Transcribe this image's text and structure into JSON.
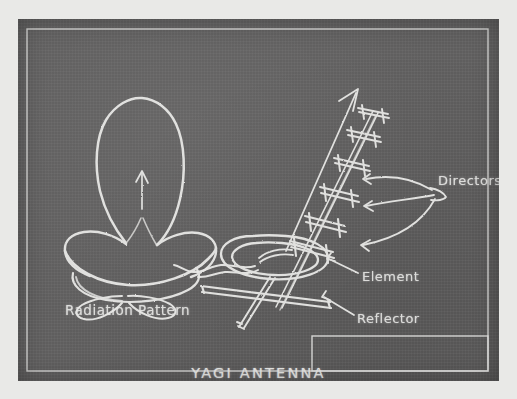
{
  "board": {
    "background_color": "#5f5e5e",
    "mat_color": "#e9e9e7",
    "chalk_color": "#e8e8e6"
  },
  "diagram": {
    "title": "YAGI ANTENNA",
    "labels": {
      "radiation_pattern": "Radiation Pattern",
      "directors": "Directors",
      "element": "Element",
      "reflector": "Reflector"
    },
    "parts": [
      {
        "name": "Radiation Pattern",
        "description": "main forward lobe with side and back lobes"
      },
      {
        "name": "Directors",
        "description": "six parasitic elements along the boom"
      },
      {
        "name": "Element",
        "description": "folded dipole driven element with feed line"
      },
      {
        "name": "Reflector",
        "description": "rear parasitic element"
      }
    ]
  }
}
